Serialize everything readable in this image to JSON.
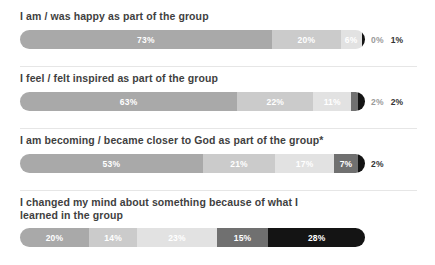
{
  "chart_data": {
    "type": "bar",
    "subtype": "100% stacked horizontal bar",
    "title": "",
    "xlabel": "",
    "ylabel": "",
    "xlim": [
      0,
      100
    ],
    "grid": false,
    "legend": "none",
    "categories": [
      "I am / was happy as part of the group",
      "I feel / felt inspired as part of the group",
      "I am becoming / became closer to God as part of the group*",
      "I changed my mind about something because of what I\nlearned in the group"
    ],
    "series": [
      {
        "name": "level-1",
        "values": [
          73,
          63,
          53,
          20
        ]
      },
      {
        "name": "level-2",
        "values": [
          20,
          22,
          21,
          14
        ]
      },
      {
        "name": "level-3",
        "values": [
          6,
          11,
          17,
          23
        ]
      },
      {
        "name": "level-4",
        "values": [
          0,
          2,
          7,
          15
        ]
      },
      {
        "name": "level-5",
        "values": [
          1,
          2,
          2,
          28
        ]
      }
    ],
    "colors": {
      "level-1": "#a9a9a9",
      "level-2": "#cbcbcb",
      "level-3": "#e2e2e2",
      "level-4": "#707070",
      "level-5": "#141414"
    }
  },
  "bars": [
    {
      "title": "I am / was happy as part of the group",
      "has_divider": false,
      "segments": [
        {
          "label": "73%",
          "value": 73,
          "color": "#a9a9a9",
          "text_color": "#ffffff",
          "inside": true
        },
        {
          "label": "20%",
          "value": 20,
          "color": "#cbcbcb",
          "text_color": "#ffffff",
          "inside": true
        },
        {
          "label": "6%",
          "value": 6,
          "color": "#e2e2e2",
          "text_color": "#ffffff",
          "inside": true
        },
        {
          "label": "",
          "value": 1,
          "color": "#141414",
          "text_color": "#ffffff",
          "inside": true
        }
      ],
      "outside": [
        {
          "label": "0%",
          "color": "#9a9a9a"
        },
        {
          "label": "1%",
          "color": "#333333"
        }
      ]
    },
    {
      "title": "I feel / felt inspired as part of the group",
      "has_divider": true,
      "segments": [
        {
          "label": "63%",
          "value": 63,
          "color": "#a9a9a9",
          "text_color": "#ffffff",
          "inside": true
        },
        {
          "label": "22%",
          "value": 22,
          "color": "#cbcbcb",
          "text_color": "#ffffff",
          "inside": true
        },
        {
          "label": "11%",
          "value": 11,
          "color": "#e2e2e2",
          "text_color": "#ffffff",
          "inside": true
        },
        {
          "label": "",
          "value": 2,
          "color": "#707070",
          "text_color": "#ffffff",
          "inside": true
        },
        {
          "label": "",
          "value": 2,
          "color": "#141414",
          "text_color": "#ffffff",
          "inside": true
        }
      ],
      "outside": [
        {
          "label": "2%",
          "color": "#9a9a9a"
        },
        {
          "label": "2%",
          "color": "#333333"
        }
      ]
    },
    {
      "title": "I am becoming / became closer to God as part of the group*",
      "has_divider": true,
      "segments": [
        {
          "label": "53%",
          "value": 53,
          "color": "#a9a9a9",
          "text_color": "#ffffff",
          "inside": true
        },
        {
          "label": "21%",
          "value": 21,
          "color": "#cbcbcb",
          "text_color": "#ffffff",
          "inside": true
        },
        {
          "label": "17%",
          "value": 17,
          "color": "#e2e2e2",
          "text_color": "#ffffff",
          "inside": true
        },
        {
          "label": "7%",
          "value": 7,
          "color": "#707070",
          "text_color": "#ffffff",
          "inside": true
        },
        {
          "label": "",
          "value": 2,
          "color": "#141414",
          "text_color": "#ffffff",
          "inside": true
        }
      ],
      "outside": [
        {
          "label": "2%",
          "color": "#333333"
        }
      ]
    },
    {
      "title": "I changed my mind about something because of what I\nlearned in the group",
      "has_divider": true,
      "segments": [
        {
          "label": "20%",
          "value": 20,
          "color": "#a9a9a9",
          "text_color": "#ffffff",
          "inside": true
        },
        {
          "label": "14%",
          "value": 14,
          "color": "#cbcbcb",
          "text_color": "#ffffff",
          "inside": true
        },
        {
          "label": "23%",
          "value": 23,
          "color": "#e2e2e2",
          "text_color": "#ffffff",
          "inside": true
        },
        {
          "label": "15%",
          "value": 15,
          "color": "#707070",
          "text_color": "#ffffff",
          "inside": true
        },
        {
          "label": "28%",
          "value": 28,
          "color": "#141414",
          "text_color": "#ffffff",
          "inside": true
        }
      ],
      "outside": []
    }
  ]
}
